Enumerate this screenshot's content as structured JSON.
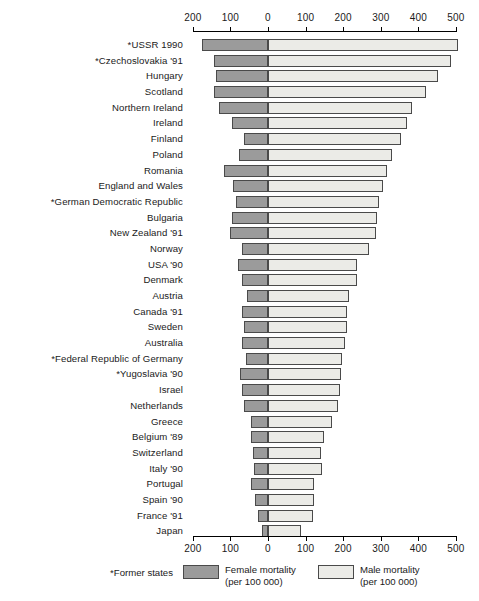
{
  "chart_data": {
    "type": "bar",
    "orientation": "horizontal",
    "layout": "bidirectional-pyramid",
    "title": "",
    "xlabel": "",
    "ylabel": "",
    "grid": false,
    "legend_position": "bottom",
    "axis_top_ticks": [
      {
        "label": "200",
        "value": -200
      },
      {
        "label": "100",
        "value": -100
      },
      {
        "label": "0",
        "value": 0
      },
      {
        "label": "100",
        "value": 100
      },
      {
        "label": "200",
        "value": 200
      },
      {
        "label": "300",
        "value": 300
      },
      {
        "label": "400",
        "value": 400
      },
      {
        "label": "500",
        "value": 500
      }
    ],
    "axis_bottom_ticks": [
      {
        "label": "200",
        "value": -200
      },
      {
        "label": "100",
        "value": -100
      },
      {
        "label": "0",
        "value": 0
      },
      {
        "label": "100",
        "value": 100
      },
      {
        "label": "200",
        "value": 200
      },
      {
        "label": "300",
        "value": 300
      },
      {
        "label": "400",
        "value": 400
      },
      {
        "label": "500",
        "value": 500
      }
    ],
    "xlim": [
      -200,
      500
    ],
    "categories": [
      "*USSR 1990",
      "*Czechoslovakia '91",
      "Hungary",
      "Scotland",
      "Northern Ireland",
      "Ireland",
      "Finland",
      "Poland",
      "Romania",
      "England and Wales",
      "*German Democratic Republic",
      "Bulgaria",
      "New Zealand '91",
      "Norway",
      "USA '90",
      "Denmark",
      "Austria",
      "Canada '91",
      "Sweden",
      "Australia",
      "*Federal Republic of Germany",
      "*Yugoslavia '90",
      "Israel",
      "Netherlands",
      "Greece",
      "Belgium '89",
      "Switzerland",
      "Italy '90",
      "Portugal",
      "Spain '90",
      "France '91",
      "Japan"
    ],
    "series": [
      {
        "name": "Female mortality (per 100 000)",
        "color": "#9b9b9b",
        "values": [
          176,
          143,
          137,
          143,
          130,
          97,
          65,
          76,
          117,
          92,
          86,
          97,
          102,
          68,
          81,
          70,
          57,
          70,
          63,
          70,
          59,
          75,
          70,
          63,
          44,
          46,
          39,
          36,
          45,
          35,
          26,
          15
        ]
      },
      {
        "name": "Male mortality (per 100 000)",
        "color": "#ebebe7",
        "values": [
          506,
          488,
          453,
          420,
          382,
          369,
          353,
          329,
          316,
          306,
          296,
          291,
          288,
          269,
          236,
          238,
          216,
          209,
          211,
          205,
          196,
          193,
          191,
          185,
          171,
          150,
          140,
          143,
          122,
          122,
          120,
          87
        ]
      }
    ],
    "footnote": "*Former states",
    "legend": [
      {
        "swatch": "female",
        "line1": "Female mortality",
        "line2": "(per 100 000)"
      },
      {
        "swatch": "male",
        "line1": "Male mortality",
        "line2": "(per 100 000)"
      }
    ]
  }
}
